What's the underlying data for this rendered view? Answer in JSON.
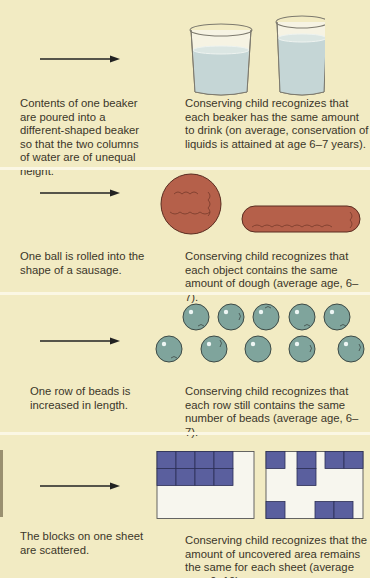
{
  "colors": {
    "background": "#f2ebc3",
    "separator": "#fbf7e4",
    "text": "#3b3629",
    "water": "#c5d6d6",
    "dough": "#b5604a",
    "bead": "#7fa49c",
    "block": "#5a5f9e",
    "sheet": "#f7f6ee"
  },
  "panels": [
    {
      "name": "liquid",
      "left_text": "Contents of one beaker are poured into a different-shaped beaker so that the two columns of water are of unequal height.",
      "right_text": "Conserving child recognizes that each beaker has the same amount to drink (on average, conservation of liquids is attained at age 6–7 years).",
      "illustration": "two-beakers-icon"
    },
    {
      "name": "substance",
      "left_text": "One ball is rolled into the shape of a sausage.",
      "right_text": "Conserving child recognizes that each object contains the same amount of dough (average age, 6–7).",
      "illustration": "dough-ball-and-sausage-icon"
    },
    {
      "name": "number",
      "left_text": "One row of beads is increased in length.",
      "right_text": "Conserving child recognizes that each row still contains the same number of beads (average age, 6–7).",
      "illustration": "bead-rows-icon",
      "beads_top_row": 5,
      "beads_bottom_row": 5
    },
    {
      "name": "area",
      "left_text": "The blocks on one sheet are scattered.",
      "right_text": "Conserving child recognizes that the amount of uncovered area remains the same for each sheet (average age, 9–10).",
      "illustration": "block-sheets-icon",
      "blocks_per_sheet": 8
    }
  ]
}
